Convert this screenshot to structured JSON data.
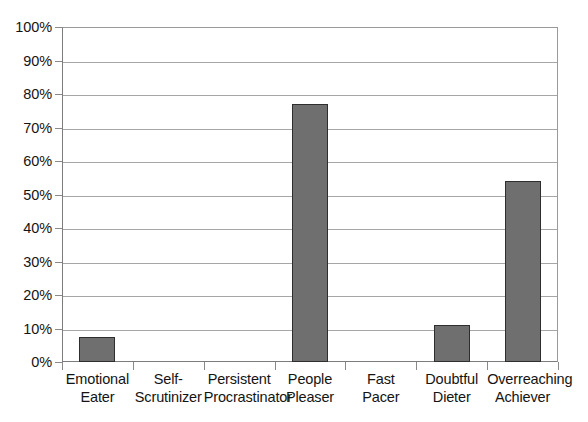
{
  "chart_data": {
    "type": "bar",
    "title": "",
    "subtitle": "",
    "xlabel": "",
    "ylabel": "",
    "categories": [
      "Emotional Eater",
      "Self-Scrutinizer",
      "Persistent Procrastinator",
      "People Pleaser",
      "Fast Pacer",
      "Doubtful Dieter",
      "Overreaching Achiever"
    ],
    "category_lines": [
      [
        "Emotional",
        "Eater"
      ],
      [
        "Self-",
        "Scrutinizer"
      ],
      [
        "Persistent",
        "Procrastinator"
      ],
      [
        "People",
        "Pleaser"
      ],
      [
        "Fast",
        "Pacer"
      ],
      [
        "Doubtful",
        "Dieter"
      ],
      [
        "Overreaching",
        "Achiever"
      ]
    ],
    "values": [
      7.5,
      0,
      0,
      77,
      0,
      11,
      54
    ],
    "value_unit": "%",
    "ylim": [
      0,
      100
    ],
    "ytick_values": [
      0,
      10,
      20,
      30,
      40,
      50,
      60,
      70,
      80,
      90,
      100
    ],
    "ytick_labels": [
      "0%",
      "10%",
      "20%",
      "30%",
      "40%",
      "50%",
      "60%",
      "70%",
      "80%",
      "90%",
      "100%"
    ],
    "grid": true,
    "grid_axis": "y",
    "legend": false,
    "legend_position": "none",
    "bar_color": "#706F6F",
    "bar_edge_color": "#2E2E2E",
    "gridline_color": "#A6A6A6",
    "axis_color": "#7C7C7C",
    "background_color": "#FFFFFF",
    "text_color": "#141414"
  }
}
